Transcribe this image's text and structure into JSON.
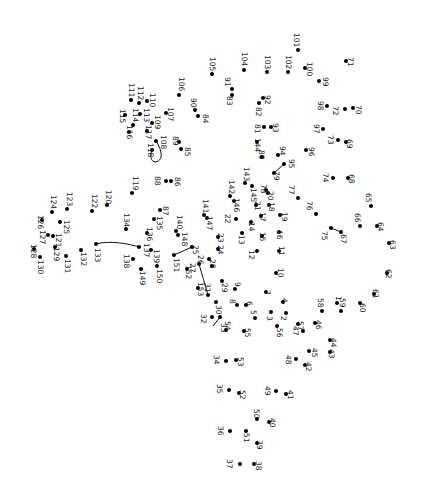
{
  "puzzle": {
    "type": "connect-the-dots",
    "orientation": "rotated 90deg clockwise",
    "dot_color": "#000000",
    "line_color": "#111111",
    "dots": [
      {
        "n": "1",
        "x": 337,
        "y": 303,
        "lx": 339,
        "ly": 296
      },
      {
        "n": "2",
        "x": 286,
        "y": 313,
        "lx": 284,
        "ly": 316
      },
      {
        "n": "3",
        "x": 271,
        "y": 312,
        "lx": 270,
        "ly": 316
      },
      {
        "n": "4",
        "x": 283,
        "y": 302,
        "lx": 285,
        "ly": 298
      },
      {
        "n": "5",
        "x": 255,
        "y": 318,
        "lx": 254,
        "ly": 310
      },
      {
        "n": "6",
        "x": 246,
        "y": 305,
        "lx": 250,
        "ly": 301
      },
      {
        "n": "7",
        "x": 266,
        "y": 292,
        "lx": 268,
        "ly": 290
      },
      {
        "n": "8",
        "x": 237,
        "y": 305,
        "lx": 233,
        "ly": 299
      },
      {
        "n": "9",
        "x": 235,
        "y": 289,
        "lx": 238,
        "ly": 282
      },
      {
        "n": "10",
        "x": 276,
        "y": 273,
        "lx": 281,
        "ly": 268
      },
      {
        "n": "11",
        "x": 279,
        "y": 251,
        "lx": 282,
        "ly": 246
      },
      {
        "n": "12",
        "x": 257,
        "y": 251,
        "lx": 252,
        "ly": 250
      },
      {
        "n": "13",
        "x": 242,
        "y": 233,
        "lx": 242,
        "ly": 235
      },
      {
        "n": "14",
        "x": 251,
        "y": 222,
        "lx": 252,
        "ly": 222
      },
      {
        "n": "15",
        "x": 262,
        "y": 236,
        "lx": 263,
        "ly": 232
      },
      {
        "n": "16",
        "x": 279,
        "y": 232,
        "lx": 280,
        "ly": 230
      },
      {
        "n": "17",
        "x": 261,
        "y": 216,
        "lx": 263,
        "ly": 212
      },
      {
        "n": "18",
        "x": 269,
        "y": 205,
        "lx": 272,
        "ly": 202
      },
      {
        "n": "19",
        "x": 280,
        "y": 215,
        "lx": 285,
        "ly": 212
      },
      {
        "n": "20",
        "x": 268,
        "y": 193,
        "lx": 271,
        "ly": 191
      },
      {
        "n": "21",
        "x": 256,
        "y": 205,
        "lx": 258,
        "ly": 201
      },
      {
        "n": "22",
        "x": 236,
        "y": 219,
        "lx": 228,
        "ly": 214
      },
      {
        "n": "23",
        "x": 218,
        "y": 237,
        "lx": 221,
        "ly": 233
      },
      {
        "n": "24",
        "x": 218,
        "y": 249,
        "lx": 221,
        "ly": 245
      },
      {
        "n": "25",
        "x": 192,
        "y": 247,
        "lx": 196,
        "ly": 245
      },
      {
        "n": "26",
        "x": 209,
        "y": 259,
        "lx": 201,
        "ly": 255
      },
      {
        "n": "27",
        "x": 199,
        "y": 264,
        "lx": 193,
        "ly": 263
      },
      {
        "n": "28",
        "x": 212,
        "y": 266,
        "lx": 213,
        "ly": 259
      },
      {
        "n": "29",
        "x": 222,
        "y": 281,
        "lx": 225,
        "ly": 283
      },
      {
        "n": "30",
        "x": 216,
        "y": 302,
        "lx": 219,
        "ly": 305
      },
      {
        "n": "31",
        "x": 208,
        "y": 295,
        "lx": 208,
        "ly": 283
      },
      {
        "n": "32",
        "x": 212,
        "y": 317,
        "lx": 204,
        "ly": 314
      },
      {
        "n": "33",
        "x": 226,
        "y": 330,
        "lx": 224,
        "ly": 323
      },
      {
        "n": "34",
        "x": 226,
        "y": 361,
        "lx": 217,
        "ly": 355
      },
      {
        "n": "35",
        "x": 229,
        "y": 390,
        "lx": 220,
        "ly": 384
      },
      {
        "n": "36",
        "x": 230,
        "y": 431,
        "lx": 221,
        "ly": 426
      },
      {
        "n": "37",
        "x": 240,
        "y": 464,
        "lx": 230,
        "ly": 459
      },
      {
        "n": "38",
        "x": 254,
        "y": 464,
        "lx": 259,
        "ly": 461
      },
      {
        "n": "39",
        "x": 257,
        "y": 443,
        "lx": 260,
        "ly": 440
      },
      {
        "n": "40",
        "x": 269,
        "y": 422,
        "lx": 273,
        "ly": 418
      },
      {
        "n": "41",
        "x": 286,
        "y": 394,
        "lx": 291,
        "ly": 390
      },
      {
        "n": "42",
        "x": 305,
        "y": 365,
        "lx": 309,
        "ly": 362
      },
      {
        "n": "43",
        "x": 330,
        "y": 352,
        "lx": 332,
        "ly": 349
      },
      {
        "n": "44",
        "x": 330,
        "y": 340,
        "lx": 334,
        "ly": 338
      },
      {
        "n": "45",
        "x": 309,
        "y": 351,
        "lx": 315,
        "ly": 348
      },
      {
        "n": "46",
        "x": 315,
        "y": 323,
        "lx": 319,
        "ly": 320
      },
      {
        "n": "47",
        "x": 303,
        "y": 331,
        "lx": 296,
        "ly": 326
      },
      {
        "n": "48",
        "x": 296,
        "y": 359,
        "lx": 289,
        "ly": 355
      },
      {
        "n": "49",
        "x": 276,
        "y": 391,
        "lx": 268,
        "ly": 386
      },
      {
        "n": "50",
        "x": 257,
        "y": 419,
        "lx": 257,
        "ly": 409
      },
      {
        "n": "51",
        "x": 246,
        "y": 431,
        "lx": 247,
        "ly": 433
      },
      {
        "n": "52",
        "x": 239,
        "y": 393,
        "lx": 243,
        "ly": 390
      },
      {
        "n": "53",
        "x": 236,
        "y": 360,
        "lx": 241,
        "ly": 357
      },
      {
        "n": "54",
        "x": 220,
        "y": 317,
        "lx": 228,
        "ly": 321
      },
      {
        "n": "55",
        "x": 244,
        "y": 331,
        "lx": 248,
        "ly": 328
      },
      {
        "n": "56",
        "x": 277,
        "y": 326,
        "lx": 280,
        "ly": 328
      },
      {
        "n": "57",
        "x": 298,
        "y": 324,
        "lx": 301,
        "ly": 321
      },
      {
        "n": "58",
        "x": 322,
        "y": 311,
        "lx": 321,
        "ly": 298
      },
      {
        "n": "59",
        "x": 341,
        "y": 311,
        "lx": 343,
        "ly": 298
      },
      {
        "n": "60",
        "x": 360,
        "y": 303,
        "lx": 363,
        "ly": 303
      },
      {
        "n": "61",
        "x": 374,
        "y": 294,
        "lx": 376,
        "ly": 289
      },
      {
        "n": "62",
        "x": 387,
        "y": 273,
        "lx": 389,
        "ly": 269
      },
      {
        "n": "63",
        "x": 389,
        "y": 243,
        "lx": 393,
        "ly": 240
      },
      {
        "n": "64",
        "x": 377,
        "y": 226,
        "lx": 381,
        "ly": 222
      },
      {
        "n": "65",
        "x": 371,
        "y": 206,
        "lx": 369,
        "ly": 193
      },
      {
        "n": "66",
        "x": 360,
        "y": 226,
        "lx": 358,
        "ly": 213
      },
      {
        "n": "67",
        "x": 341,
        "y": 232,
        "lx": 344,
        "ly": 234
      },
      {
        "n": "68",
        "x": 348,
        "y": 178,
        "lx": 352,
        "ly": 174
      },
      {
        "n": "69",
        "x": 346,
        "y": 142,
        "lx": 350,
        "ly": 139
      },
      {
        "n": "70",
        "x": 353,
        "y": 108,
        "lx": 359,
        "ly": 105
      },
      {
        "n": "71",
        "x": 346,
        "y": 61,
        "lx": 351,
        "ly": 57
      },
      {
        "n": "72",
        "x": 345,
        "y": 109,
        "lx": 336,
        "ly": 106
      },
      {
        "n": "73",
        "x": 338,
        "y": 140,
        "lx": 331,
        "ly": 135
      },
      {
        "n": "74",
        "x": 333,
        "y": 178,
        "lx": 326,
        "ly": 173
      },
      {
        "n": "75",
        "x": 331,
        "y": 228,
        "lx": 325,
        "ly": 231
      },
      {
        "n": "76",
        "x": 316,
        "y": 214,
        "lx": 310,
        "ly": 201
      },
      {
        "n": "77",
        "x": 298,
        "y": 198,
        "lx": 292,
        "ly": 185
      },
      {
        "n": "78",
        "x": 266,
        "y": 190,
        "lx": 264,
        "ly": 184
      },
      {
        "n": "79",
        "x": 274,
        "y": 173,
        "lx": 277,
        "ly": 171
      },
      {
        "n": "80",
        "x": 262,
        "y": 157,
        "lx": 262,
        "ly": 150
      },
      {
        "n": "81",
        "x": 264,
        "y": 127,
        "lx": 258,
        "ly": 124
      },
      {
        "n": "82",
        "x": 259,
        "y": 103,
        "lx": 259,
        "ly": 107
      },
      {
        "n": "83",
        "x": 232,
        "y": 95,
        "lx": 230,
        "ly": 96
      },
      {
        "n": "84",
        "x": 198,
        "y": 116,
        "lx": 206,
        "ly": 114
      },
      {
        "n": "85",
        "x": 181,
        "y": 149,
        "lx": 188,
        "ly": 147
      },
      {
        "n": "86",
        "x": 171,
        "y": 181,
        "lx": 178,
        "ly": 177
      },
      {
        "n": "87",
        "x": 160,
        "y": 210,
        "lx": 166,
        "ly": 206
      },
      {
        "n": "88",
        "x": 166,
        "y": 181,
        "lx": 158,
        "ly": 176
      },
      {
        "n": "89",
        "x": 179,
        "y": 142,
        "lx": 176,
        "ly": 136
      },
      {
        "n": "90",
        "x": 195,
        "y": 110,
        "lx": 194,
        "ly": 98
      },
      {
        "n": "91",
        "x": 232,
        "y": 89,
        "lx": 228,
        "ly": 77
      },
      {
        "n": "92",
        "x": 263,
        "y": 98,
        "lx": 268,
        "ly": 95
      },
      {
        "n": "93",
        "x": 271,
        "y": 127,
        "lx": 276,
        "ly": 123
      },
      {
        "n": "94",
        "x": 278,
        "y": 155,
        "lx": 283,
        "ly": 146
      },
      {
        "n": "95",
        "x": 284,
        "y": 164,
        "lx": 292,
        "ly": 159
      },
      {
        "n": "96",
        "x": 306,
        "y": 150,
        "lx": 312,
        "ly": 147
      },
      {
        "n": "97",
        "x": 323,
        "y": 129,
        "lx": 317,
        "ly": 124
      },
      {
        "n": "98",
        "x": 327,
        "y": 106,
        "lx": 321,
        "ly": 101
      },
      {
        "n": "99",
        "x": 319,
        "y": 81,
        "lx": 326,
        "ly": 77
      },
      {
        "n": "100",
        "x": 305,
        "y": 68,
        "lx": 310,
        "ly": 62
      },
      {
        "n": "101",
        "x": 298,
        "y": 50,
        "lx": 297,
        "ly": 33
      },
      {
        "n": "102",
        "x": 288,
        "y": 72,
        "lx": 289,
        "ly": 55
      },
      {
        "n": "103",
        "x": 267,
        "y": 72,
        "lx": 268,
        "ly": 55
      },
      {
        "n": "104",
        "x": 244,
        "y": 70,
        "lx": 245,
        "ly": 52
      },
      {
        "n": "105",
        "x": 212,
        "y": 74,
        "lx": 213,
        "ly": 57
      },
      {
        "n": "106",
        "x": 179,
        "y": 95,
        "lx": 182,
        "ly": 77
      },
      {
        "n": "107",
        "x": 166,
        "y": 113,
        "lx": 171,
        "ly": 107
      },
      {
        "n": "108",
        "x": 156,
        "y": 141,
        "lx": 164,
        "ly": 135
      },
      {
        "n": "109",
        "x": 152,
        "y": 123,
        "lx": 158,
        "ly": 115
      },
      {
        "n": "110",
        "x": 147,
        "y": 101,
        "lx": 153,
        "ly": 93
      },
      {
        "n": "111",
        "x": 131,
        "y": 100,
        "lx": 132,
        "ly": 83
      },
      {
        "n": "112",
        "x": 139,
        "y": 103,
        "lx": 141,
        "ly": 86
      },
      {
        "n": "113",
        "x": 140,
        "y": 114,
        "lx": 147,
        "ly": 108
      },
      {
        "n": "114",
        "x": 133,
        "y": 125,
        "lx": 136,
        "ly": 108
      },
      {
        "n": "115",
        "x": 125,
        "y": 115,
        "lx": 123,
        "ly": 109
      },
      {
        "n": "116",
        "x": 129,
        "y": 132,
        "lx": 130,
        "ly": 125
      },
      {
        "n": "117",
        "x": 147,
        "y": 131,
        "lx": 149,
        "ly": 125
      },
      {
        "n": "118",
        "x": 152,
        "y": 150,
        "lx": 151,
        "ly": 143
      },
      {
        "n": "119",
        "x": 132,
        "y": 193,
        "lx": 136,
        "ly": 176
      },
      {
        "n": "120",
        "x": 107,
        "y": 205,
        "lx": 109,
        "ly": 190
      },
      {
        "n": "121",
        "x": 53,
        "y": 236,
        "lx": 59,
        "ly": 233
      },
      {
        "n": "122",
        "x": 92,
        "y": 211,
        "lx": 95,
        "ly": 194
      },
      {
        "n": "123",
        "x": 67,
        "y": 209,
        "lx": 70,
        "ly": 192
      },
      {
        "n": "124",
        "x": 52,
        "y": 212,
        "lx": 54,
        "ly": 195
      },
      {
        "n": "125",
        "x": 60,
        "y": 222,
        "lx": 67,
        "ly": 220
      },
      {
        "n": "126",
        "x": 42,
        "y": 220,
        "lx": 41,
        "ly": 215
      },
      {
        "n": "127",
        "x": 48,
        "y": 235,
        "lx": 43,
        "ly": 230
      },
      {
        "n": "128",
        "x": 34,
        "y": 249,
        "lx": 34,
        "ly": 244
      },
      {
        "n": "129",
        "x": 55,
        "y": 247,
        "lx": 57,
        "ly": 247
      },
      {
        "n": "130",
        "x": 40,
        "y": 257,
        "lx": 41,
        "ly": 260
      },
      {
        "n": "131",
        "x": 66,
        "y": 256,
        "lx": 68,
        "ly": 259
      },
      {
        "n": "132",
        "x": 81,
        "y": 250,
        "lx": 84,
        "ly": 252
      },
      {
        "n": "133",
        "x": 96,
        "y": 244,
        "lx": 98,
        "ly": 248
      },
      {
        "n": "134",
        "x": 126,
        "y": 229,
        "lx": 127,
        "ly": 213
      },
      {
        "n": "135",
        "x": 154,
        "y": 219,
        "lx": 160,
        "ly": 216
      },
      {
        "n": "136",
        "x": 147,
        "y": 233,
        "lx": 150,
        "ly": 227
      },
      {
        "n": "137",
        "x": 139,
        "y": 247,
        "lx": 147,
        "ly": 243
      },
      {
        "n": "138",
        "x": 133,
        "y": 259,
        "lx": 127,
        "ly": 254
      },
      {
        "n": "139",
        "x": 151,
        "y": 250,
        "lx": 157,
        "ly": 249
      },
      {
        "n": "140",
        "x": 176,
        "y": 231,
        "lx": 180,
        "ly": 215
      },
      {
        "n": "141",
        "x": 204,
        "y": 215,
        "lx": 206,
        "ly": 199
      },
      {
        "n": "142",
        "x": 230,
        "y": 196,
        "lx": 232,
        "ly": 180
      },
      {
        "n": "143",
        "x": 245,
        "y": 183,
        "lx": 247,
        "ly": 167
      },
      {
        "n": "144",
        "x": 257,
        "y": 142,
        "lx": 258,
        "ly": 138
      },
      {
        "n": "145",
        "x": 252,
        "y": 186,
        "lx": 254,
        "ly": 188
      },
      {
        "n": "146",
        "x": 234,
        "y": 201,
        "lx": 237,
        "ly": 198
      },
      {
        "n": "147",
        "x": 207,
        "y": 218,
        "lx": 210,
        "ly": 216
      },
      {
        "n": "148",
        "x": 178,
        "y": 235,
        "lx": 185,
        "ly": 232
      },
      {
        "n": "149",
        "x": 141,
        "y": 269,
        "lx": 143,
        "ly": 271
      },
      {
        "n": "150",
        "x": 157,
        "y": 266,
        "lx": 160,
        "ly": 269
      },
      {
        "n": "151",
        "x": 174,
        "y": 255,
        "lx": 177,
        "ly": 258
      },
      {
        "n": "152",
        "x": 187,
        "y": 269,
        "lx": 189,
        "ly": 265
      },
      {
        "n": "153",
        "x": 198,
        "y": 288,
        "lx": 201,
        "ly": 282
      }
    ],
    "drawn_lines": [
      {
        "from": "133",
        "to": "137",
        "d": "M96,244 C110,240 130,244 139,247"
      },
      {
        "from": "25",
        "to": "151",
        "d": "M192,247 L174,255"
      },
      {
        "from": "27",
        "to": "31",
        "d": "M199,264 L208,295"
      },
      {
        "from": "54",
        "to": "33",
        "d": "M220,317 L213,326"
      },
      {
        "from": "95",
        "to": "79",
        "d": "M284,164 L274,173"
      },
      {
        "from": "75",
        "to": "67",
        "d": "M331,228 L341,232"
      },
      {
        "from": "108",
        "to": "118",
        "d": "M156,141 C163,152 163,160 156,162 C150,162 150,155 152,150"
      }
    ]
  }
}
